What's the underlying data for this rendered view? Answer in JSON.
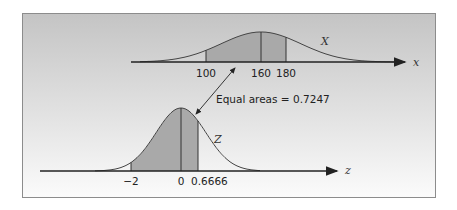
{
  "chart_data": {
    "type": "area",
    "title": "",
    "panels": [
      {
        "name": "X",
        "axis_label": "x",
        "distribution": "normal",
        "mean": 160,
        "shaded_range": [
          100,
          180
        ],
        "ticks": [
          {
            "value": 100,
            "label": "100"
          },
          {
            "value": 160,
            "label": "160"
          },
          {
            "value": 180,
            "label": "180"
          }
        ]
      },
      {
        "name": "Z",
        "axis_label": "z",
        "distribution": "standard normal",
        "mean": 0,
        "shaded_range": [
          -2,
          0.6666
        ],
        "ticks": [
          {
            "value": -2,
            "label": "−2"
          },
          {
            "value": 0,
            "label": "0"
          },
          {
            "value": 0.6666,
            "label": "0.6666"
          }
        ]
      }
    ],
    "annotations": [
      {
        "text": "Equal areas = 0.7247",
        "type": "double-arrow",
        "connects": [
          "X shaded area",
          "Z shaded area"
        ]
      }
    ],
    "shaded_area": 0.7247,
    "grid": false
  },
  "labels": {
    "x_curve_name": "X",
    "x_axis_name": "x",
    "x_ticks": [
      "100",
      "160",
      "180"
    ],
    "z_curve_name": "Z",
    "z_axis_name": "z",
    "z_ticks": [
      "−2",
      "0",
      "0.6666"
    ],
    "annotation": "Equal areas = 0.7247"
  },
  "colors": {
    "frame_top": "#c4c4c4",
    "frame_bottom": "#fbfbfb",
    "shade": "#a9a9a9",
    "line": "#333333"
  }
}
